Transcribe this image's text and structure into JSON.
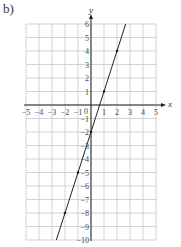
{
  "part_label": "b)",
  "chart_data": {
    "type": "line",
    "title": "",
    "xlabel": "x",
    "ylabel": "y",
    "xlim": [
      -5,
      5
    ],
    "ylim": [
      -10,
      6
    ],
    "grid": true,
    "x_ticks": [
      "-5",
      "-4",
      "-3",
      "-2",
      "-1",
      "0",
      "1",
      "2",
      "3",
      "4",
      "5"
    ],
    "y_ticks": [
      "6",
      "5",
      "4",
      "3",
      "2",
      "1",
      "-1",
      "-2",
      "-3",
      "-4",
      "-5",
      "-6",
      "-7",
      "-8",
      "-9",
      "-10"
    ],
    "series": [
      {
        "name": "y = 3x - 2",
        "equation": "y = 3x - 2",
        "x": [
          -2,
          -1,
          0,
          1,
          2
        ],
        "y": [
          -8,
          -5,
          -2,
          1,
          4
        ],
        "marked_points": [
          [
            -2,
            -8
          ],
          [
            -1,
            -5
          ],
          [
            0,
            -2
          ],
          [
            1,
            1
          ],
          [
            2,
            4
          ]
        ]
      }
    ]
  },
  "colors": {
    "grid": "#c8c8c8",
    "axis": "#222222",
    "line": "#222222"
  }
}
